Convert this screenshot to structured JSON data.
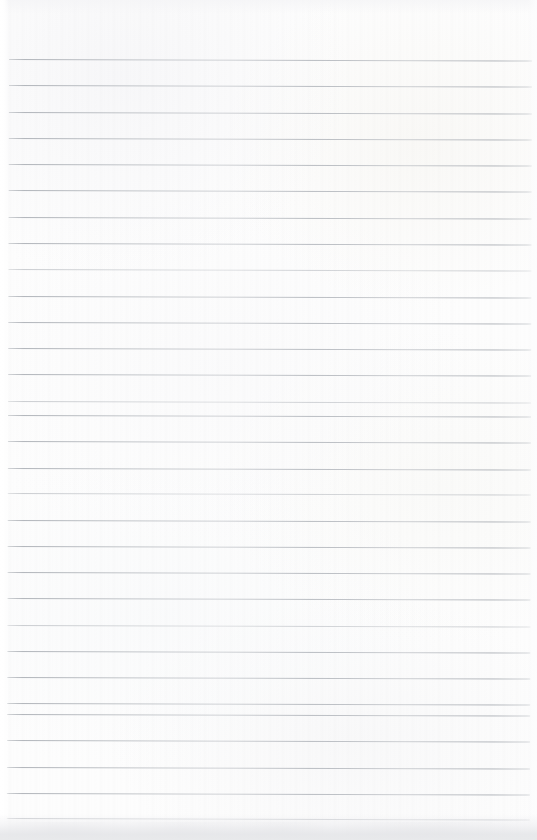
{
  "document": {
    "kind": "ruled-notebook-page",
    "title": "Blank ruled notebook page",
    "caption": "",
    "page_width": 537,
    "page_height": 840,
    "background_color": "#fdfdfd",
    "paper_tint": "#fbfbfc",
    "is_blank": true,
    "written_content": ""
  },
  "ruling": {
    "style": "wide-ruled horizontal lines",
    "line_color": "#b2b6bb",
    "line_thickness_px": 1,
    "line_spacing_px": 26.3,
    "line_count": 30,
    "first_line_y": 59,
    "last_line_y": 818,
    "line_start_x": 8,
    "line_end_x": 531,
    "skew_degrees": 0.17,
    "margin_top_px": 59,
    "margin_left_px": 8,
    "margin_right_px": 6,
    "has_vertical_margin_rule": false,
    "has_holes": false,
    "lines": [
      {
        "index": 1,
        "y": 59,
        "weight": "strong"
      },
      {
        "index": 2,
        "y": 85,
        "weight": "normal"
      },
      {
        "index": 3,
        "y": 112,
        "weight": "strong"
      },
      {
        "index": 4,
        "y": 138,
        "weight": "normal"
      },
      {
        "index": 5,
        "y": 164,
        "weight": "strong"
      },
      {
        "index": 6,
        "y": 190,
        "weight": "normal"
      },
      {
        "index": 7,
        "y": 217,
        "weight": "strong"
      },
      {
        "index": 8,
        "y": 243,
        "weight": "normal"
      },
      {
        "index": 9,
        "y": 269,
        "weight": "faint"
      },
      {
        "index": 10,
        "y": 296,
        "weight": "strong"
      },
      {
        "index": 11,
        "y": 322,
        "weight": "normal"
      },
      {
        "index": 12,
        "y": 348,
        "weight": "strong"
      },
      {
        "index": 13,
        "y": 374,
        "weight": "normal"
      },
      {
        "index": 14,
        "y": 401,
        "weight": "faint"
      },
      {
        "index": 15,
        "y": 415,
        "weight": "normal"
      },
      {
        "index": 16,
        "y": 441,
        "weight": "strong"
      },
      {
        "index": 17,
        "y": 468,
        "weight": "normal"
      },
      {
        "index": 18,
        "y": 493,
        "weight": "faint"
      },
      {
        "index": 19,
        "y": 520,
        "weight": "strong"
      },
      {
        "index": 20,
        "y": 546,
        "weight": "normal"
      },
      {
        "index": 21,
        "y": 572,
        "weight": "strong"
      },
      {
        "index": 22,
        "y": 598,
        "weight": "normal"
      },
      {
        "index": 23,
        "y": 625,
        "weight": "faint"
      },
      {
        "index": 24,
        "y": 651,
        "weight": "strong"
      },
      {
        "index": 25,
        "y": 677,
        "weight": "normal"
      },
      {
        "index": 26,
        "y": 703,
        "weight": "strong"
      },
      {
        "index": 27,
        "y": 714,
        "weight": "normal"
      },
      {
        "index": 28,
        "y": 740,
        "weight": "strong"
      },
      {
        "index": 29,
        "y": 767,
        "weight": "normal"
      },
      {
        "index": 30,
        "y": 793,
        "weight": "strong"
      },
      {
        "index": 31,
        "y": 818,
        "weight": "faint"
      }
    ]
  },
  "scan_artifacts": {
    "bottom_shadow": true,
    "bottom_shadow_color": "#e4e5e8",
    "left_edge_highlight": true,
    "top_edge_shading": true,
    "grain": true
  }
}
